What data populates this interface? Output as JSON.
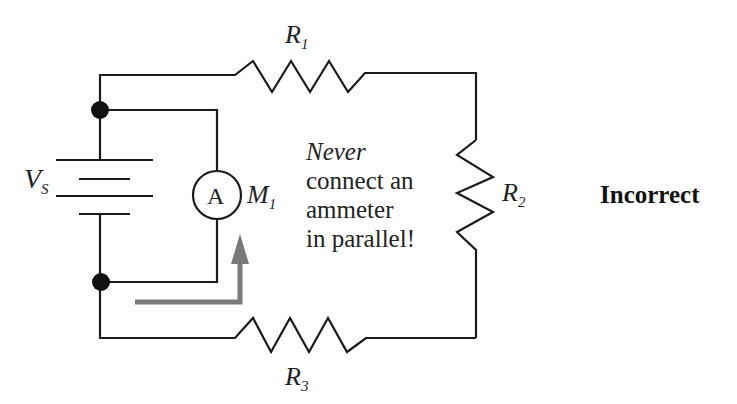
{
  "diagram": {
    "type": "circuit-schematic",
    "components": {
      "source": {
        "symbol": "V",
        "subscript": "S"
      },
      "ammeter": {
        "glyph": "A",
        "symbol": "M",
        "subscript": "1"
      },
      "r1": {
        "symbol": "R",
        "subscript": "1"
      },
      "r2": {
        "symbol": "R",
        "subscript": "2"
      },
      "r3": {
        "symbol": "R",
        "subscript": "3"
      }
    },
    "note": {
      "line1": "Never",
      "line2": "connect an",
      "line3": "ammeter",
      "line4": "in parallel!"
    },
    "verdict": "Incorrect",
    "colors": {
      "wire": "#1a1a1a",
      "arrow": "#7a7a7a",
      "text": "#222222",
      "background": "#ffffff"
    }
  }
}
